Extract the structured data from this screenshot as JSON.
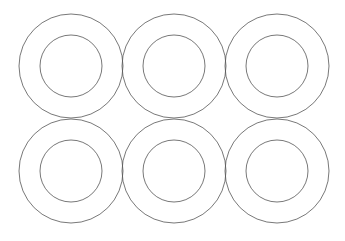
{
  "canvas": {
    "width": 345,
    "height": 241,
    "background": "#ffffff"
  },
  "style": {
    "stroke": "#555555",
    "stroke_width": 0.8
  },
  "rings": [
    {
      "cx": 71,
      "cy": 66,
      "outer_r": 52,
      "inner_r": 31
    },
    {
      "cx": 174,
      "cy": 66,
      "outer_r": 52,
      "inner_r": 31
    },
    {
      "cx": 277,
      "cy": 66,
      "outer_r": 52,
      "inner_r": 31
    },
    {
      "cx": 71,
      "cy": 171,
      "outer_r": 52,
      "inner_r": 31
    },
    {
      "cx": 174,
      "cy": 171,
      "outer_r": 52,
      "inner_r": 31
    },
    {
      "cx": 277,
      "cy": 171,
      "outer_r": 52,
      "inner_r": 31
    }
  ]
}
